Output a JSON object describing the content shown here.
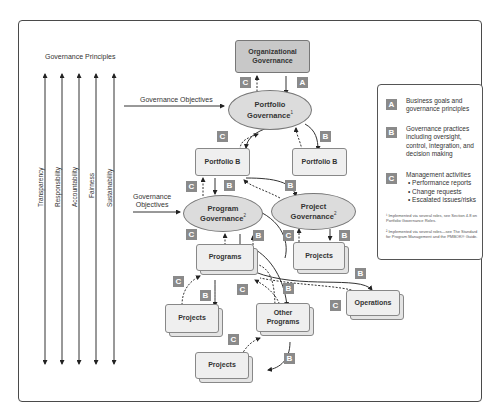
{
  "principles": {
    "title": "Governance Principles",
    "items": [
      "Transparency",
      "Responsibility",
      "Accountability",
      "Fairness",
      "Sustainability"
    ]
  },
  "objectives": {
    "portfolio_label": "Governance Objectives",
    "program_label_line1": "Governance",
    "program_label_line2": "Objectives"
  },
  "nodes": {
    "organizational": {
      "line1": "Organizational",
      "line2": "Governance"
    },
    "portfolio_governance": {
      "line1": "Portfolio",
      "line2": "Governance",
      "sup": "1"
    },
    "portfolio_b_left": "Portfolio B",
    "portfolio_b_right": "Portfolio B",
    "program_governance": {
      "line1": "Program",
      "line2": "Governance",
      "sup": "2"
    },
    "project_governance": {
      "line1": "Project",
      "line2": "Governance",
      "sup": "2"
    },
    "programs": "Programs",
    "projects_right": "Projects",
    "projects_left": "Projects",
    "other_programs": {
      "line1": "Other",
      "line2": "Programs"
    },
    "operations": "Operations",
    "projects_bottom": "Projects"
  },
  "badges": {
    "a": "A",
    "b": "B",
    "c": "C"
  },
  "legend": {
    "a": {
      "badge": "A",
      "text": "Business goals and governance principles"
    },
    "b": {
      "badge": "B",
      "text": "Governance practices including oversight, control, integration, and decision making"
    },
    "c": {
      "badge": "C",
      "text": "Management activities",
      "bullets": [
        "Performance reports",
        "Change requests",
        "Escalated issues/risks"
      ]
    },
    "footnote1": "¹ Implemented via several roles, see Section 4.8 on Portfolio Governance Roles.",
    "footnote2": "² Implemented via several roles—see The Standard for Program Management and the PMBOK® Guide."
  },
  "colors": {
    "badge": "#8a8a8a",
    "ellipse_fill": "#dcdcdc",
    "org_fill": "#c8c8c8",
    "box_fill": "#efefef",
    "line": "#333333"
  }
}
